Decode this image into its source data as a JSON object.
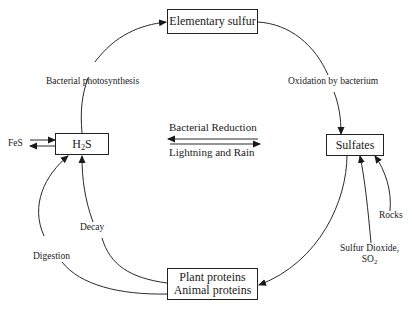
{
  "diagram": {
    "nodes": {
      "elementary_sulfur": "Elementary sulfur",
      "h2s_prefix": "H",
      "h2s_sub": "2",
      "h2s_suffix": "S",
      "sulfates": "Sulfates",
      "proteins_line1": "Plant proteins",
      "proteins_line2": "Animal proteins"
    },
    "labels": {
      "bacterial_photosynthesis": "Bacterial photosynthesis",
      "oxidation_by_bacterium": "Oxidation by bacterium",
      "bacterial_reduction": "Bacterial Reduction",
      "lightning_and_rain": "Lightning and Rain",
      "fes": "FeS",
      "decay": "Decay",
      "digestion": "Digestion",
      "rocks": "Rocks",
      "sulfur_dioxide_line1": "Sulfur Dioxide,",
      "so2_prefix": "SO",
      "so2_sub": "2"
    },
    "edges": [
      {
        "from": "H2S",
        "to": "Elementary sulfur",
        "label": "Bacterial photosynthesis"
      },
      {
        "from": "Elementary sulfur",
        "to": "Sulfates",
        "label": "Oxidation by bacterium"
      },
      {
        "from": "Sulfates",
        "to": "H2S",
        "label": "Bacterial Reduction"
      },
      {
        "from": "H2S",
        "to": "Sulfates",
        "label": "Lightning and Rain"
      },
      {
        "from": "Sulfates",
        "to": "Plant proteins / Animal proteins",
        "label": ""
      },
      {
        "from": "Plant proteins / Animal proteins",
        "to": "H2S",
        "label": "Decay"
      },
      {
        "from": "Plant proteins / Animal proteins",
        "to": "H2S",
        "label": "Digestion"
      },
      {
        "from": "Rocks",
        "to": "Sulfates",
        "label": "Rocks"
      },
      {
        "from": "Sulfur Dioxide, SO2",
        "to": "Sulfates",
        "label": "Sulfur Dioxide, SO2"
      },
      {
        "from": "FeS",
        "to": "H2S",
        "label": "FeS",
        "bidirectional": true
      }
    ]
  }
}
